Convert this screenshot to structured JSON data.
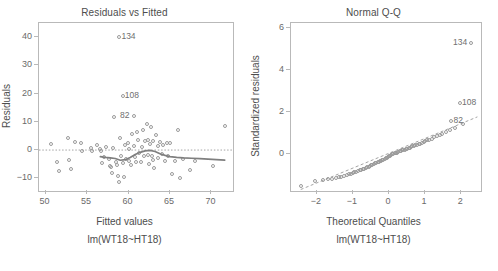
{
  "figure": {
    "width": 498,
    "height": 271,
    "background": "#ffffff",
    "point_color": "#9a9a9a",
    "axis_color": "#b9b9b9",
    "text_color": "#4d4d4d",
    "smoother_color": "#7f7f7f",
    "refline_color": "#9a9a9a"
  },
  "chart_data": [
    {
      "type": "scatter",
      "title": "Residuals vs Fitted",
      "xlabel": "Fitted values",
      "sublabel": "lm(WT18~HT18)",
      "ylabel": "Residuals",
      "xlim": [
        49.2,
        72.6
      ],
      "ylim": [
        -14.5,
        45.0
      ],
      "xticks": [
        50,
        55,
        60,
        65,
        70
      ],
      "yticks": [
        -10,
        0,
        10,
        20,
        30,
        40
      ],
      "grid": false,
      "legend": "none",
      "reference_line": {
        "type": "horizontal",
        "y": 0,
        "style": "dotted"
      },
      "smoother": {
        "name": "loess",
        "style": "solid",
        "x": [
          56.6,
          57.2,
          57.8,
          58.4,
          59.0,
          59.6,
          60.2,
          60.8,
          61.4,
          62.0,
          62.6,
          63.2,
          63.8,
          64.4,
          65.0,
          65.8,
          66.6,
          67.6,
          68.6,
          69.6,
          70.6,
          71.6
        ],
        "y": [
          -2.3,
          -2.6,
          -2.8,
          -3.0,
          -3.6,
          -3.4,
          -2.6,
          -1.6,
          -0.8,
          -0.3,
          -0.1,
          -0.5,
          -1.3,
          -1.9,
          -2.3,
          -2.6,
          -2.8,
          -2.9,
          -3.0,
          -3.2,
          -3.4,
          -3.6
        ]
      },
      "labeled_points": [
        {
          "label": "134",
          "x": 58.9,
          "y": 40.2,
          "label_side": "right"
        },
        {
          "label": "108",
          "x": 59.3,
          "y": 19.1,
          "label_side": "right"
        },
        {
          "label": "82",
          "x": 60.6,
          "y": 12.0,
          "label_side": "left"
        }
      ],
      "points": [
        {
          "x": 50.7,
          "y": 2.1
        },
        {
          "x": 51.4,
          "y": -4.1
        },
        {
          "x": 51.6,
          "y": -7.4
        },
        {
          "x": 52.7,
          "y": 4.4
        },
        {
          "x": 52.8,
          "y": -3.4
        },
        {
          "x": 53.0,
          "y": -6.6
        },
        {
          "x": 53.6,
          "y": 2.9
        },
        {
          "x": 54.3,
          "y": 2.6
        },
        {
          "x": 54.4,
          "y": -0.2
        },
        {
          "x": 55.5,
          "y": 0.6
        },
        {
          "x": 55.6,
          "y": -0.5
        },
        {
          "x": 56.2,
          "y": 1.8
        },
        {
          "x": 56.5,
          "y": 0.2
        },
        {
          "x": 56.7,
          "y": -0.2
        },
        {
          "x": 56.8,
          "y": -4.6
        },
        {
          "x": 57.1,
          "y": -2.4
        },
        {
          "x": 57.3,
          "y": 1.2
        },
        {
          "x": 57.6,
          "y": -3.0
        },
        {
          "x": 57.8,
          "y": -5.6
        },
        {
          "x": 57.9,
          "y": -6.1
        },
        {
          "x": 58.0,
          "y": -8.3
        },
        {
          "x": 58.1,
          "y": 0.9
        },
        {
          "x": 58.3,
          "y": 11.7
        },
        {
          "x": 58.5,
          "y": -4.3
        },
        {
          "x": 58.6,
          "y": -5.2
        },
        {
          "x": 58.7,
          "y": -9.1
        },
        {
          "x": 58.8,
          "y": -11.4
        },
        {
          "x": 59.0,
          "y": 4.4
        },
        {
          "x": 59.1,
          "y": -2.1
        },
        {
          "x": 59.3,
          "y": -4.6
        },
        {
          "x": 59.4,
          "y": -9.7
        },
        {
          "x": 59.6,
          "y": 1.7
        },
        {
          "x": 59.7,
          "y": -3.2
        },
        {
          "x": 59.9,
          "y": 2.4
        },
        {
          "x": 60.0,
          "y": 0.4
        },
        {
          "x": 60.1,
          "y": -3.9
        },
        {
          "x": 60.3,
          "y": -5.4
        },
        {
          "x": 60.4,
          "y": 5.6
        },
        {
          "x": 60.6,
          "y": 1.3
        },
        {
          "x": 60.8,
          "y": -2.6
        },
        {
          "x": 60.9,
          "y": -4.4
        },
        {
          "x": 61.0,
          "y": 6.3
        },
        {
          "x": 61.2,
          "y": 3.6
        },
        {
          "x": 61.3,
          "y": -1.2
        },
        {
          "x": 61.5,
          "y": -4.2
        },
        {
          "x": 61.6,
          "y": 1.0
        },
        {
          "x": 61.8,
          "y": 7.1
        },
        {
          "x": 61.9,
          "y": -2.0
        },
        {
          "x": 62.0,
          "y": 3.1
        },
        {
          "x": 62.2,
          "y": 9.4
        },
        {
          "x": 62.3,
          "y": 3.4
        },
        {
          "x": 62.4,
          "y": -1.6
        },
        {
          "x": 62.5,
          "y": -5.0
        },
        {
          "x": 62.6,
          "y": 2.0
        },
        {
          "x": 62.7,
          "y": 8.0
        },
        {
          "x": 62.8,
          "y": -2.2
        },
        {
          "x": 62.9,
          "y": 3.2
        },
        {
          "x": 63.0,
          "y": -3.4
        },
        {
          "x": 63.1,
          "y": -6.2
        },
        {
          "x": 63.3,
          "y": 5.2
        },
        {
          "x": 63.5,
          "y": 1.4
        },
        {
          "x": 63.6,
          "y": -2.8
        },
        {
          "x": 63.8,
          "y": 2.7
        },
        {
          "x": 64.0,
          "y": -1.4
        },
        {
          "x": 64.2,
          "y": 1.9
        },
        {
          "x": 64.4,
          "y": -3.8
        },
        {
          "x": 64.6,
          "y": 2.5
        },
        {
          "x": 64.8,
          "y": -2.0
        },
        {
          "x": 65.0,
          "y": 2.4
        },
        {
          "x": 65.2,
          "y": -8.6
        },
        {
          "x": 65.6,
          "y": -4.0
        },
        {
          "x": 66.0,
          "y": 7.2
        },
        {
          "x": 66.2,
          "y": -10.0
        },
        {
          "x": 66.6,
          "y": -3.2
        },
        {
          "x": 67.4,
          "y": -7.2
        },
        {
          "x": 68.0,
          "y": -3.8
        },
        {
          "x": 70.2,
          "y": -5.8
        },
        {
          "x": 71.6,
          "y": 8.6
        }
      ]
    },
    {
      "type": "scatter",
      "title": "Normal Q-Q",
      "xlabel": "Theoretical Quantiles",
      "sublabel": "lm(WT18~HT18)",
      "ylabel": "Standardized residuals",
      "xlim": [
        -2.72,
        2.55
      ],
      "ylim": [
        -1.75,
        6.25
      ],
      "xticks": [
        -2,
        -1,
        0,
        1,
        2
      ],
      "yticks": [
        0,
        2,
        4,
        6
      ],
      "grid": false,
      "legend": "none",
      "reference_line": {
        "type": "qq",
        "style": "dashed",
        "x0": -2.45,
        "y0": -1.68,
        "x1": 2.45,
        "y1": 1.78
      },
      "labeled_points": [
        {
          "label": "134",
          "x": 2.28,
          "y": 5.28,
          "label_side": "left"
        },
        {
          "label": "108",
          "x": 1.97,
          "y": 2.42,
          "label_side": "right"
        },
        {
          "label": "82",
          "x": 1.73,
          "y": 1.58,
          "label_side": "right"
        }
      ],
      "points": [
        {
          "x": -2.45,
          "y": -1.52
        },
        {
          "x": -2.05,
          "y": -1.28
        },
        {
          "x": -1.84,
          "y": -1.22
        },
        {
          "x": -1.7,
          "y": -1.19
        },
        {
          "x": -1.58,
          "y": -1.16
        },
        {
          "x": -1.48,
          "y": -1.13
        },
        {
          "x": -1.4,
          "y": -1.1
        },
        {
          "x": -1.32,
          "y": -1.06
        },
        {
          "x": -1.25,
          "y": -1.02
        },
        {
          "x": -1.18,
          "y": -0.98
        },
        {
          "x": -1.12,
          "y": -0.95
        },
        {
          "x": -1.06,
          "y": -0.92
        },
        {
          "x": -1.01,
          "y": -0.89
        },
        {
          "x": -0.96,
          "y": -0.86
        },
        {
          "x": -0.91,
          "y": -0.83
        },
        {
          "x": -0.86,
          "y": -0.8
        },
        {
          "x": -0.82,
          "y": -0.77
        },
        {
          "x": -0.77,
          "y": -0.74
        },
        {
          "x": -0.73,
          "y": -0.71
        },
        {
          "x": -0.69,
          "y": -0.68
        },
        {
          "x": -0.65,
          "y": -0.65
        },
        {
          "x": -0.61,
          "y": -0.62
        },
        {
          "x": -0.57,
          "y": -0.59
        },
        {
          "x": -0.54,
          "y": -0.56
        },
        {
          "x": -0.5,
          "y": -0.53
        },
        {
          "x": -0.46,
          "y": -0.5
        },
        {
          "x": -0.43,
          "y": -0.47
        },
        {
          "x": -0.39,
          "y": -0.44
        },
        {
          "x": -0.36,
          "y": -0.41
        },
        {
          "x": -0.32,
          "y": -0.38
        },
        {
          "x": -0.29,
          "y": -0.35
        },
        {
          "x": -0.26,
          "y": -0.33
        },
        {
          "x": -0.22,
          "y": -0.3
        },
        {
          "x": -0.19,
          "y": -0.28
        },
        {
          "x": -0.16,
          "y": -0.25
        },
        {
          "x": -0.12,
          "y": -0.22
        },
        {
          "x": -0.09,
          "y": -0.19
        },
        {
          "x": -0.06,
          "y": -0.16
        },
        {
          "x": -0.03,
          "y": -0.13
        },
        {
          "x": 0.0,
          "y": -0.1
        },
        {
          "x": 0.03,
          "y": -0.07
        },
        {
          "x": 0.06,
          "y": -0.04
        },
        {
          "x": 0.09,
          "y": -0.01
        },
        {
          "x": 0.12,
          "y": 0.02
        },
        {
          "x": 0.16,
          "y": 0.04
        },
        {
          "x": 0.19,
          "y": 0.06
        },
        {
          "x": 0.22,
          "y": 0.08
        },
        {
          "x": 0.26,
          "y": 0.11
        },
        {
          "x": 0.29,
          "y": 0.14
        },
        {
          "x": 0.32,
          "y": 0.16
        },
        {
          "x": 0.36,
          "y": 0.18
        },
        {
          "x": 0.39,
          "y": 0.2
        },
        {
          "x": 0.43,
          "y": 0.22
        },
        {
          "x": 0.46,
          "y": 0.25
        },
        {
          "x": 0.5,
          "y": 0.27
        },
        {
          "x": 0.54,
          "y": 0.29
        },
        {
          "x": 0.57,
          "y": 0.32
        },
        {
          "x": 0.61,
          "y": 0.34
        },
        {
          "x": 0.65,
          "y": 0.37
        },
        {
          "x": 0.69,
          "y": 0.4
        },
        {
          "x": 0.73,
          "y": 0.42
        },
        {
          "x": 0.77,
          "y": 0.45
        },
        {
          "x": 0.82,
          "y": 0.48
        },
        {
          "x": 0.86,
          "y": 0.51
        },
        {
          "x": 0.91,
          "y": 0.54
        },
        {
          "x": 0.96,
          "y": 0.58
        },
        {
          "x": 1.01,
          "y": 0.62
        },
        {
          "x": 1.06,
          "y": 0.66
        },
        {
          "x": 1.12,
          "y": 0.7
        },
        {
          "x": 1.18,
          "y": 0.75
        },
        {
          "x": 1.25,
          "y": 0.8
        },
        {
          "x": 1.32,
          "y": 0.86
        },
        {
          "x": 1.4,
          "y": 0.92
        },
        {
          "x": 1.48,
          "y": 0.98
        },
        {
          "x": 1.58,
          "y": 1.05
        },
        {
          "x": 1.7,
          "y": 1.14
        },
        {
          "x": 1.84,
          "y": 1.26
        },
        {
          "x": 2.05,
          "y": 1.44
        }
      ]
    }
  ]
}
